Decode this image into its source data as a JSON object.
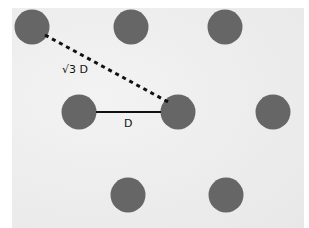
{
  "diagram": {
    "type": "hexagonal-lattice",
    "colors": {
      "dot": "#666666",
      "line": "#111111",
      "background": "#ececec"
    },
    "dot_radius": 17.5,
    "dots": [
      {
        "x": 32,
        "y": 27
      },
      {
        "x": 131,
        "y": 27
      },
      {
        "x": 225,
        "y": 27
      },
      {
        "x": 79,
        "y": 112
      },
      {
        "x": 178,
        "y": 112
      },
      {
        "x": 273,
        "y": 112
      },
      {
        "x": 128,
        "y": 195
      },
      {
        "x": 226,
        "y": 195
      }
    ],
    "solid_line": {
      "x1": 96,
      "y1": 112,
      "x2": 161,
      "y2": 112
    },
    "dashed_line": {
      "x1": 45,
      "y1": 35,
      "x2": 170,
      "y2": 103
    },
    "labels": {
      "diagonal": "√3 D",
      "horizontal": "D"
    }
  }
}
